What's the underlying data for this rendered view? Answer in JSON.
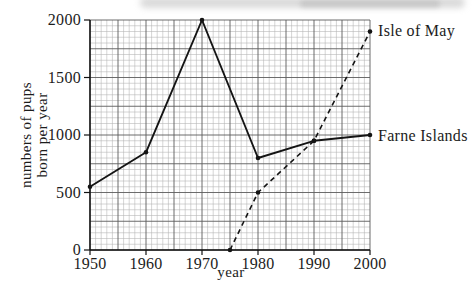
{
  "chart_data": {
    "type": "line",
    "title": "",
    "xlabel": "year",
    "ylabel": "numbers of pups born per year",
    "ylabel_lines": [
      "numbers of pups",
      "born per year"
    ],
    "xlim": [
      1950,
      2000
    ],
    "ylim": [
      0,
      2000
    ],
    "x_ticks": [
      1950,
      1960,
      1970,
      1980,
      1990,
      2000
    ],
    "y_ticks": [
      0,
      500,
      1000,
      1500,
      2000
    ],
    "grid": {
      "on": true,
      "minor_x_step_years": 1,
      "major_x_step_years": 5,
      "minor_y_step_pups": 50,
      "major_y_step_pups": 250,
      "minor_color": "#b2b2b2",
      "major_color": "#5c5c5c"
    },
    "legend_position": "inline-right-annotations",
    "line_color": "#141414",
    "series": [
      {
        "name": "Farne Islands",
        "label": "Farne Islands",
        "style": "solid",
        "points": [
          [
            1950,
            550
          ],
          [
            1960,
            850
          ],
          [
            1970,
            2000
          ],
          [
            1980,
            800
          ],
          [
            1990,
            950
          ],
          [
            2000,
            1000
          ]
        ]
      },
      {
        "name": "Isle of May",
        "label": "Isle of May",
        "style": "dashed",
        "points": [
          [
            1975,
            0
          ],
          [
            1980,
            500
          ],
          [
            1990,
            950
          ],
          [
            2000,
            1900
          ]
        ]
      }
    ]
  }
}
